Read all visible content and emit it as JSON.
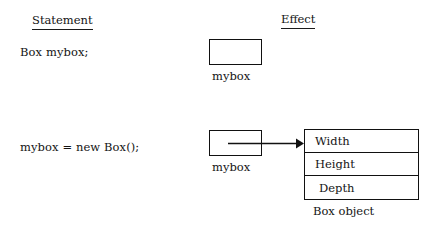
{
  "figure": {
    "columns": {
      "statement_header": "Statement",
      "effect_header": "Effect"
    },
    "rows": [
      {
        "statement": "Box mybox;",
        "reference_box_label": "mybox",
        "has_arrow": false
      },
      {
        "statement": "mybox = new Box();",
        "reference_box_label": "mybox",
        "has_arrow": true
      }
    ],
    "object": {
      "fields": [
        "Width",
        "Height",
        "Depth"
      ],
      "caption": "Box object"
    },
    "icons": {
      "arrow": "arrow-right-icon"
    },
    "colors": {
      "background": "#ffffff",
      "ink": "#141414",
      "stroke": "#111111"
    }
  }
}
